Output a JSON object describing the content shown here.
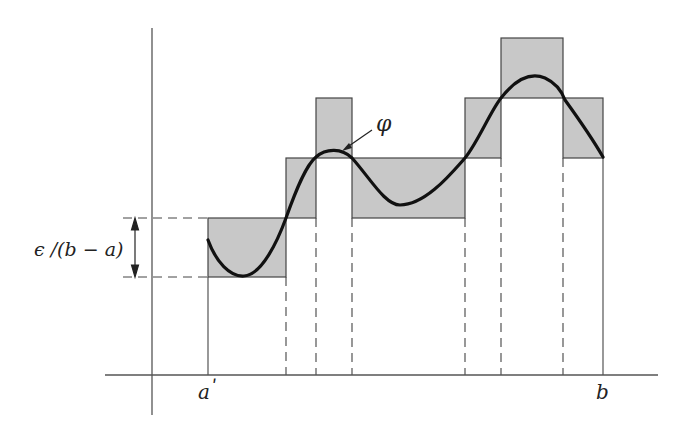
{
  "diagram": {
    "labels": {
      "function": "φ",
      "left_endpoint": "a",
      "left_endpoint_prime": "ʹ",
      "right_endpoint": "b",
      "height_annotation": "ϵ /(b − a)"
    },
    "colors": {
      "rect_fill": "#c8c8c8",
      "rect_stroke": "#444444",
      "curve": "#111111",
      "axis": "#555555",
      "dash": "#444444"
    },
    "axes": {
      "y_axis": {
        "x": 152,
        "y1": 28,
        "y2": 415
      },
      "x_axis": {
        "y": 375,
        "x1": 105,
        "x2": 658
      }
    },
    "rectangles": [
      {
        "x1": 208,
        "x2": 286,
        "y1": 218,
        "y2": 277
      },
      {
        "x1": 286,
        "x2": 316,
        "y1": 158,
        "y2": 218
      },
      {
        "x1": 316,
        "x2": 352,
        "y1": 98,
        "y2": 158
      },
      {
        "x1": 352,
        "x2": 465,
        "y1": 158,
        "y2": 218
      },
      {
        "x1": 465,
        "x2": 501,
        "y1": 98,
        "y2": 158
      },
      {
        "x1": 501,
        "x2": 563,
        "y1": 38,
        "y2": 98
      },
      {
        "x1": 563,
        "x2": 603,
        "y1": 98,
        "y2": 158
      }
    ],
    "partition_points": [
      208,
      286,
      316,
      352,
      465,
      501,
      563,
      603
    ],
    "height_marker": {
      "x": 135,
      "y_top": 218,
      "y_bottom": 277
    }
  }
}
